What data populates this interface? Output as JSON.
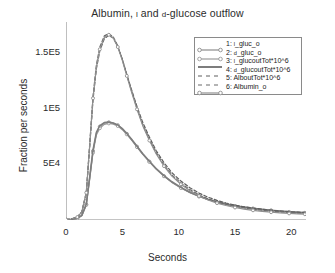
{
  "chart_data": {
    "type": "line",
    "title": "Albumin, L and D-glucose outflow",
    "title_parts": {
      "pre": "Albumin, ",
      "sc1": "l",
      "mid": " and ",
      "sc2": "d",
      "post": "-glucose outflow"
    },
    "xlabel": "Seconds",
    "ylabel": "Fraction per seconds",
    "xlim": [
      0,
      21.3
    ],
    "ylim": [
      0,
      178000
    ],
    "xticks": [
      0,
      5,
      10,
      15,
      20
    ],
    "xtick_labels": [
      "0",
      "5",
      "10",
      "15",
      "20"
    ],
    "yticks": [
      50000,
      100000,
      150000
    ],
    "ytick_labels": [
      "5E4",
      "1E5",
      "1.5E5"
    ],
    "grid": false,
    "legend_position": "upper right",
    "x": [
      0,
      0.5,
      1.0,
      1.4,
      1.8,
      2.1,
      2.4,
      2.7,
      3.0,
      3.4,
      3.8,
      4.2,
      4.6,
      5.0,
      5.4,
      5.8,
      6.3,
      6.8,
      7.4,
      8.0,
      8.7,
      9.4,
      10.2,
      11.0,
      11.8,
      12.6,
      13.4,
      14.2,
      15.0,
      15.8,
      16.6,
      17.4,
      18.2,
      19.0,
      19.8,
      20.6,
      21.2
    ],
    "series": [
      {
        "name": "1: L_gluc_o",
        "label_parts": {
          "num": "1: ",
          "sc": "l",
          "rest": "_gluc_o"
        },
        "style": "solid-markers",
        "color": "#8c8c8c",
        "marker": "circle",
        "values": [
          300,
          600,
          1500,
          4000,
          14000,
          38000,
          62000,
          78000,
          84000,
          87200,
          87800,
          87000,
          85200,
          82000,
          77500,
          72500,
          66000,
          59500,
          52500,
          46000,
          39500,
          34000,
          29000,
          24800,
          21300,
          18500,
          16200,
          14300,
          12700,
          11400,
          10300,
          9400,
          8600,
          7900,
          7300,
          6800,
          6500
        ]
      },
      {
        "name": "2: D_gluc_o",
        "label_parts": {
          "num": "2: ",
          "sc": "d",
          "rest": "_gluc_o"
        },
        "style": "solid-markers",
        "color": "#9a9a9a",
        "marker": "circle",
        "values": [
          280,
          560,
          1400,
          3800,
          13500,
          37000,
          60500,
          76500,
          82500,
          86000,
          86800,
          86200,
          84500,
          81200,
          77000,
          72000,
          65500,
          59200,
          52200,
          45800,
          39300,
          33800,
          28800,
          24600,
          21100,
          18300,
          16000,
          14100,
          12500,
          11200,
          10100,
          9200,
          8400,
          7700,
          7100,
          6600,
          6300
        ]
      },
      {
        "name": "3: L_glucoutTot*10^6",
        "label_parts": {
          "num": "3: ",
          "sc": "l",
          "rest": "_glucoutTot*10^6"
        },
        "style": "solid",
        "color": "#7d7d7d",
        "marker": "none",
        "values": [
          300,
          620,
          1550,
          4100,
          14300,
          38600,
          62800,
          78800,
          84800,
          87600,
          88000,
          87200,
          85400,
          82200,
          77800,
          72800,
          66300,
          59800,
          52800,
          46300,
          39800,
          34300,
          29300,
          25000,
          21500,
          18700,
          16400,
          14500,
          12900,
          11600,
          10500,
          9600,
          8800,
          8100,
          7500,
          7000,
          6700
        ]
      },
      {
        "name": "4: D_glucoutTot*10^6",
        "label_parts": {
          "num": "4: ",
          "sc": "d",
          "rest": "_glucoutTot*10^6"
        },
        "style": "dashed",
        "color": "#5f5f5f",
        "marker": "none",
        "values": [
          400,
          900,
          2600,
          7000,
          24000,
          66000,
          108000,
          136000,
          152000,
          163000,
          166000,
          163500,
          156000,
          144500,
          131000,
          117500,
          102000,
          88000,
          74500,
          62500,
          51500,
          42500,
          35000,
          29000,
          24200,
          20500,
          17600,
          15300,
          13400,
          11900,
          10700,
          9700,
          8800,
          8100,
          7500,
          7000,
          6700
        ]
      },
      {
        "name": "5: AlboutTot*10^6",
        "label_parts": {
          "num": "5: ",
          "sc": "",
          "rest": "AlboutTot*10^6"
        },
        "style": "dashed",
        "color": "#6b6b6b",
        "marker": "none",
        "values": [
          420,
          950,
          2700,
          7300,
          25000,
          68000,
          111000,
          139500,
          155500,
          165500,
          167500,
          164500,
          156500,
          144500,
          130500,
          116500,
          100500,
          86000,
          72500,
          60500,
          49500,
          40500,
          33200,
          27300,
          22600,
          19000,
          16200,
          14000,
          12200,
          10800,
          9600,
          8700,
          7900,
          7200,
          6700,
          6200,
          5900
        ]
      },
      {
        "name": "6: Albumin_o",
        "label_parts": {
          "num": "6: ",
          "sc": "",
          "rest": "Albumin_o"
        },
        "style": "solid-markers",
        "color": "#8f8f8f",
        "marker": "circle",
        "values": [
          410,
          930,
          2650,
          7150,
          24500,
          67000,
          109500,
          137500,
          153500,
          164000,
          166500,
          163500,
          155500,
          143500,
          129500,
          115500,
          99500,
          85000,
          71500,
          59500,
          48500,
          39500,
          32200,
          26300,
          21600,
          18000,
          15200,
          13000,
          11200,
          9800,
          8700,
          7800,
          7000,
          6400,
          5900,
          5500,
          5200
        ]
      }
    ]
  }
}
